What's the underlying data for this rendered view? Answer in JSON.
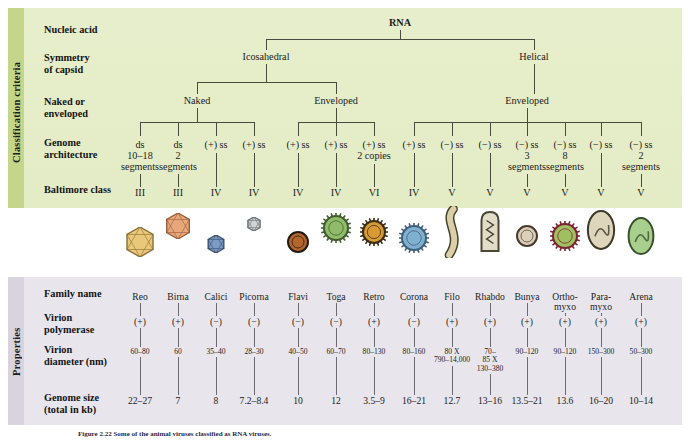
{
  "figure": {
    "caption": "Figure 2.22  Some of the animal viruses classified as RNA viruses."
  },
  "classification": {
    "spine_label": "Classification criteria",
    "rows": [
      {
        "key": "nucleic_acid",
        "label": "Nucleic acid"
      },
      {
        "key": "symmetry",
        "label": "Symmetry\nof capsid"
      },
      {
        "key": "naked_enveloped",
        "label": "Naked or\nenveloped"
      },
      {
        "key": "genome_architecture",
        "label": "Genome\narchitecture"
      },
      {
        "key": "baltimore",
        "label": "Baltimore class"
      }
    ],
    "root": "RNA",
    "symmetry_nodes": [
      "Icosahedral",
      "Helical"
    ],
    "envelope_nodes": [
      "Naked",
      "Enveloped",
      "Enveloped"
    ],
    "genome_architecture": [
      "ds\n10–18\nsegments",
      "ds\n2\nsegments",
      "(+) ss",
      "(+) ss",
      "(+) ss",
      "(+) ss",
      "(+) ss\n2 copies",
      "(+) ss",
      "(−) ss",
      "(−) ss",
      "(−) ss\n3\nsegments",
      "(−) ss\n8\nsegments",
      "(−) ss",
      "(−) ss\n2\nsegments"
    ],
    "baltimore_class": [
      "III",
      "III",
      "IV",
      "IV",
      "IV",
      "IV",
      "VI",
      "IV",
      "V",
      "V",
      "V",
      "V",
      "V",
      "V"
    ]
  },
  "properties": {
    "spine_label": "Properties",
    "row_labels": [
      "Family name",
      "Virion\npolymerase",
      "Virion\ndiameter (nm)",
      "Genome size\n(total in kb)"
    ],
    "family_name": [
      "Reo",
      "Birna",
      "Calici",
      "Picorna",
      "Flavi",
      "Toga",
      "Retro",
      "Corona",
      "Filo",
      "Rhabdo",
      "Bunya",
      "Ortho-\nmyxo",
      "Para-\nmyxo",
      "Arena"
    ],
    "virion_polymerase": [
      "(+)",
      "(+)",
      "(−)",
      "(−)",
      "(−)",
      "(−)",
      "(+)",
      "(−)",
      "(+)",
      "(+)",
      "(+)",
      "(+)",
      "(+)",
      "(+)"
    ],
    "virion_diameter": [
      "60–80",
      "60",
      "35–40",
      "28–30",
      "40–50",
      "60–70",
      "80–130",
      "80–160",
      "80 X\n790–14,000",
      "70–\n85 X\n130–380",
      "90–120",
      "90–120",
      "150–300",
      "50–300"
    ],
    "genome_size": [
      "22–27",
      "7",
      "8",
      "7.2–8.4",
      "10",
      "12",
      "3.5–9",
      "16–21",
      "12.7",
      "13–16",
      "13.5–21",
      "13.6",
      "16–20",
      "10–14"
    ]
  },
  "virions": [
    {
      "name": "reo-virion",
      "shape": "icosahedron",
      "fill": "#e9c87a",
      "stroke": "#8a6f33"
    },
    {
      "name": "birna-virion",
      "shape": "icosahedron",
      "fill": "#e8a77a",
      "stroke": "#9a5f3a"
    },
    {
      "name": "calici-virion",
      "shape": "icosahedron",
      "fill": "#7e9bc4",
      "stroke": "#3c5273"
    },
    {
      "name": "picorna-virion",
      "shape": "icosahedron",
      "fill": "#cfd3d6",
      "stroke": "#6c7278"
    },
    {
      "name": "flavi-virion",
      "shape": "enveloped-round",
      "fill": "#b4652c",
      "stroke": "#221a12"
    },
    {
      "name": "toga-virion",
      "shape": "spiked-round",
      "fill": "#8fbb6a",
      "stroke": "#3e5c2c"
    },
    {
      "name": "retro-virion",
      "shape": "spiked-round",
      "fill": "#d79a34",
      "stroke": "#3b2c14"
    },
    {
      "name": "corona-virion",
      "shape": "spiked-round",
      "fill": "#7fb0cf",
      "stroke": "#3d5f7a"
    },
    {
      "name": "filo-virion",
      "shape": "filament-curved",
      "fill": "#d9cfa8",
      "stroke": "#4a422b"
    },
    {
      "name": "rhabdo-virion",
      "shape": "bullet",
      "fill": "#e2ddc8",
      "stroke": "#4a4735"
    },
    {
      "name": "bunya-virion",
      "shape": "enveloped-round",
      "fill": "#dcd0bb",
      "stroke": "#4a3a2a"
    },
    {
      "name": "orthomyxo-virion",
      "shape": "spiked-round",
      "fill": "#9fbf62",
      "stroke": "#7b2130"
    },
    {
      "name": "paramyxo-virion",
      "shape": "enveloped-oval",
      "fill": "#ddd6bc",
      "stroke": "#3d3a2a"
    },
    {
      "name": "arena-virion",
      "shape": "enveloped-oval",
      "fill": "#a9cf8e",
      "stroke": "#39502c"
    }
  ],
  "colors": {
    "classification_bg": "#e5edc7",
    "classification_spine": "#c5d68b",
    "properties_bg": "#e8e6ec",
    "properties_spine": "#d9d3de",
    "line": "#4b4b3d"
  },
  "layout": {
    "column_x": [
      140,
      178,
      216,
      254,
      298,
      336,
      374,
      414,
      452,
      490,
      527,
      565,
      601,
      641
    ],
    "row_y": {
      "nucleic_acid": 22,
      "symmetry": 55,
      "naked_enveloped": 100,
      "genome_architecture": 140,
      "baltimore": 188,
      "family_name": 292,
      "virion_polymerase": 317,
      "virion_diameter": 348,
      "genome_size": 396
    }
  }
}
